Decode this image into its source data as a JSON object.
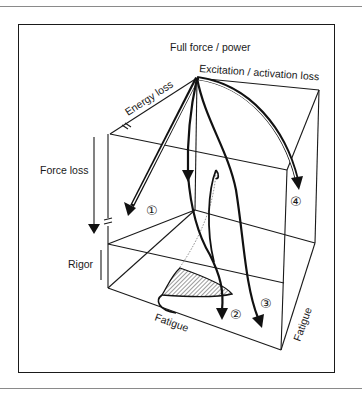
{
  "diagram": {
    "type": "3d-cube-fatigue-model",
    "labels": {
      "top": "Full force / power",
      "excitation": "Excitation / activation loss",
      "energy": "Energy loss",
      "force": "Force loss",
      "rigor": "Rigor",
      "fatigue_bottom": "Fatigue",
      "fatigue_right": "Fatigue"
    },
    "pathways": [
      {
        "id": 1,
        "marker": "①"
      },
      {
        "id": 2,
        "marker": "②"
      },
      {
        "id": 3,
        "marker": "③"
      },
      {
        "id": 4,
        "marker": "④"
      }
    ],
    "colors": {
      "ink": "#1a1a1a",
      "background": "#ffffff",
      "rule": "#8a8a8a"
    }
  }
}
